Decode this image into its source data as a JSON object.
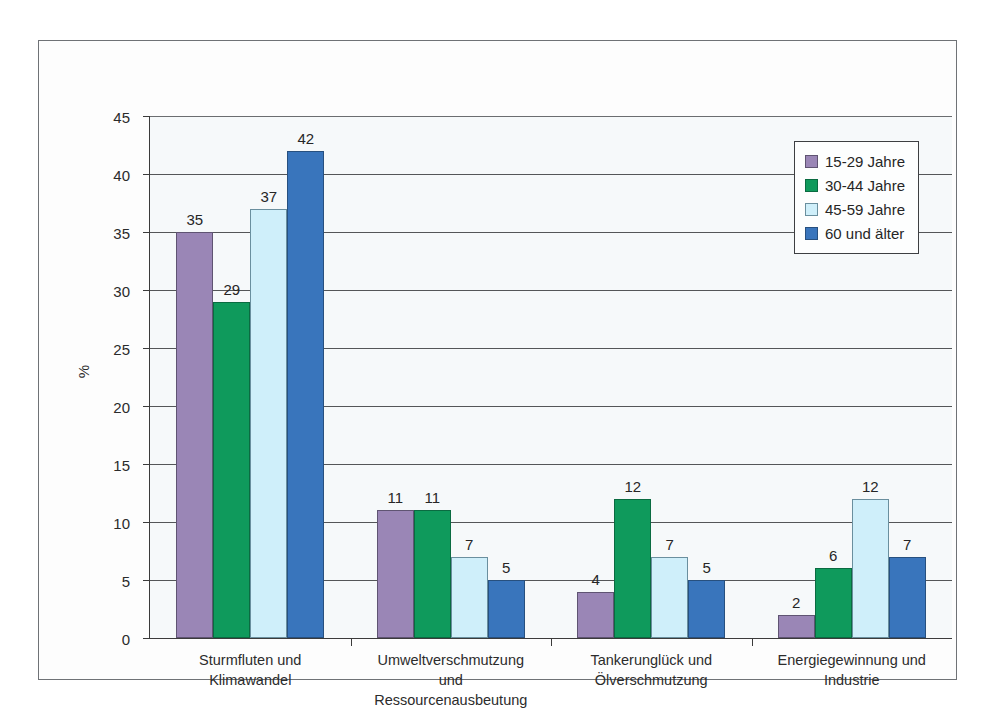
{
  "chart_data": {
    "type": "bar",
    "title": "",
    "subtitle": "",
    "xlabel": "",
    "ylabel": "%",
    "ylim": [
      0,
      45
    ],
    "ytick_step": 5,
    "yticks": [
      45,
      40,
      35,
      30,
      25,
      20,
      15,
      10,
      5,
      0
    ],
    "grid": true,
    "legend_position": "top-right",
    "categories": [
      "Sturmfluten und Klimawandel",
      "Umweltverschmutzung und Ressourcenausbeutung",
      "Tankerunglück und Ölverschmutzung",
      "Energiegewinnung und Industrie"
    ],
    "category_lines": [
      [
        "Sturmfluten und",
        "Klimawandel"
      ],
      [
        "Umweltverschmutzung",
        "und",
        "Ressourcenausbeutung"
      ],
      [
        "Tankerunglück und",
        "Ölverschmutzung"
      ],
      [
        "Energiegewinnung und",
        "Industrie"
      ]
    ],
    "series": [
      {
        "name": "15-29 Jahre",
        "color": "#9a86b6",
        "values": [
          35,
          11,
          4,
          2
        ]
      },
      {
        "name": "30-44 Jahre",
        "color": "#0f9a5c",
        "values": [
          29,
          11,
          12,
          6
        ]
      },
      {
        "name": "45-59 Jahre",
        "color": "#cfeffa",
        "values": [
          37,
          7,
          7,
          12
        ]
      },
      {
        "name": "60 und älter",
        "color": "#3975bc",
        "values": [
          42,
          5,
          5,
          7
        ]
      }
    ],
    "data_labels": [
      [
        35,
        29,
        37,
        42
      ],
      [
        11,
        11,
        7,
        5
      ],
      [
        4,
        12,
        7,
        5
      ],
      [
        2,
        6,
        12,
        7
      ]
    ]
  },
  "legend": {
    "items": [
      {
        "label": "15-29 Jahre",
        "color": "#9a86b6"
      },
      {
        "label": "30-44 Jahre",
        "color": "#0f9a5c"
      },
      {
        "label": "45-59 Jahre",
        "color": "#cfeffa"
      },
      {
        "label": "60 und älter",
        "color": "#3975bc"
      }
    ]
  },
  "axes": {
    "y_title": "%"
  }
}
